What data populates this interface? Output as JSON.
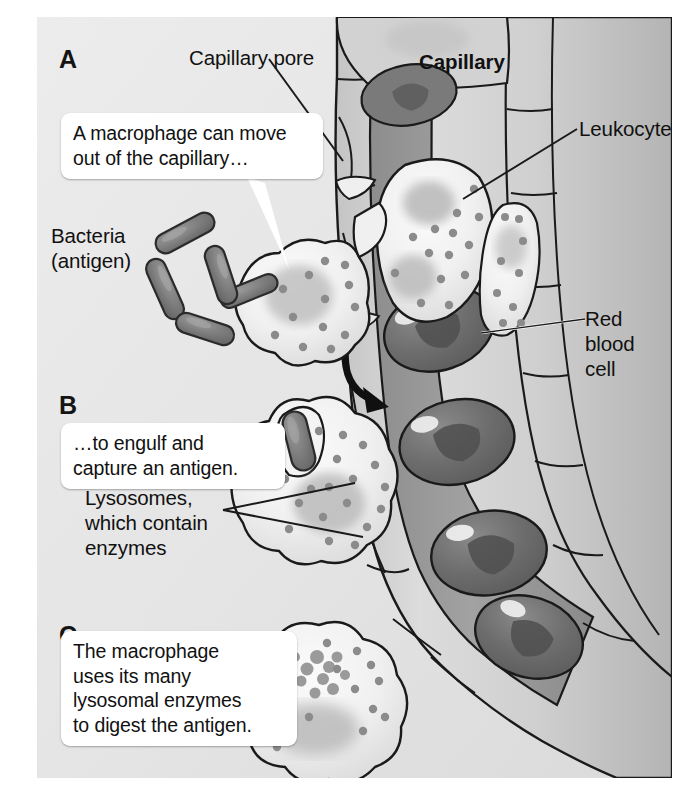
{
  "figure": {
    "background_color": "#e6e6e6",
    "plate_border_color": "#ffffff",
    "ink_color": "#1a1a1a"
  },
  "panels": [
    {
      "id": "A",
      "letter": "A"
    },
    {
      "id": "B",
      "letter": "B"
    },
    {
      "id": "C",
      "letter": "C"
    }
  ],
  "callouts": [
    {
      "id": "callout-a",
      "text": "A macrophage can move\nout of the capillary…",
      "panel": "A"
    },
    {
      "id": "callout-b",
      "text": "…to engulf and\ncapture an antigen.",
      "panel": "B"
    },
    {
      "id": "callout-c",
      "text": "The macrophage\nuses its many\nlysosomal enzymes\nto digest the antigen.",
      "panel": "C"
    }
  ],
  "labels": [
    {
      "id": "capillary-pore",
      "text": "Capillary pore",
      "bold": false
    },
    {
      "id": "capillary",
      "text": "Capillary",
      "bold": true
    },
    {
      "id": "leukocyte",
      "text": "Leukocyte",
      "bold": false
    },
    {
      "id": "red-blood-cell",
      "text": "Red blood\ncell",
      "bold": false
    },
    {
      "id": "bacteria-antigen",
      "text": "Bacteria\n(antigen)",
      "bold": false
    },
    {
      "id": "lysosomes",
      "text": "Lysosomes,\nwhich contain\nenzymes",
      "bold": false
    }
  ],
  "structures": {
    "capillary": {
      "lumen_color": "#9a9a9a",
      "wall_color": "#cfcfcf",
      "outline_color": "#1a1a1a",
      "endothelial_cell_count": 12
    },
    "red_blood_cells": {
      "count": 5,
      "fill_color": "#6f6f6f",
      "dimple_color": "#545454",
      "highlight_color": "#f0f0f0",
      "shape": "biconcave-disc"
    },
    "leukocytes": {
      "count": 2,
      "fill_color": "#f2f2f2",
      "granule_color": "#8d8d8d",
      "location": "inside-capillary"
    },
    "macrophages": [
      {
        "panel": "A",
        "state": "migrating-through-pore",
        "lysosome_count": 18
      },
      {
        "panel": "B",
        "state": "engulfing-antigen",
        "lysosome_count": 21
      },
      {
        "panel": "C",
        "state": "digesting-antigen",
        "lysosome_count": 20
      }
    ],
    "bacteria": {
      "count_free": 4,
      "fill_color": "#7c7c7c",
      "outline_color": "#2b2b2b",
      "shape": "rod"
    },
    "migration_arrow": {
      "id": "migration-arrow",
      "color": "#101010",
      "description": "curved arrow showing leukocyte exiting capillary"
    }
  }
}
